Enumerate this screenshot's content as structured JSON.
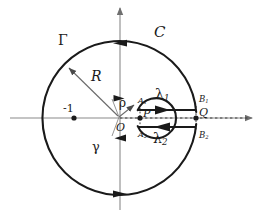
{
  "figure": {
    "type": "keyhole-contour-diagram",
    "background": "#ffffff",
    "stroke_color": "#1a1a1a",
    "axis_color": "#888888",
    "width": 267,
    "height": 214
  },
  "geometry": {
    "origin": {
      "x": 120,
      "y": 118
    },
    "outer_radius": 77,
    "inner_radius": 20,
    "cut_y_upper": 110,
    "cut_y_lower": 127,
    "cut_x_start": 140,
    "cut_x_end": 196
  },
  "labels": {
    "outer_contour": "C",
    "outer_arc": "Γ",
    "inner_contour": "γ",
    "radius_outer": "R",
    "radius_inner": "ρ",
    "origin": "O",
    "point_p": "P",
    "point_q": "Q",
    "pole_minus_one": "-1",
    "cut_upper_path": "λ",
    "cut_upper_path_sub": "1",
    "cut_lower_path": "λ",
    "cut_lower_path_sub": "2",
    "inner_upper_point": "A",
    "inner_upper_point_sub": "1",
    "inner_lower_point": "A",
    "inner_lower_point_sub": "2",
    "outer_upper_point": "B",
    "outer_upper_point_sub": "1",
    "outer_lower_point": "B",
    "outer_lower_point_sub": "2"
  },
  "points": {
    "minus_one": {
      "x": 74,
      "y": 118
    },
    "p": {
      "x": 140,
      "y": 118
    },
    "q": {
      "x": 196,
      "y": 118
    }
  }
}
